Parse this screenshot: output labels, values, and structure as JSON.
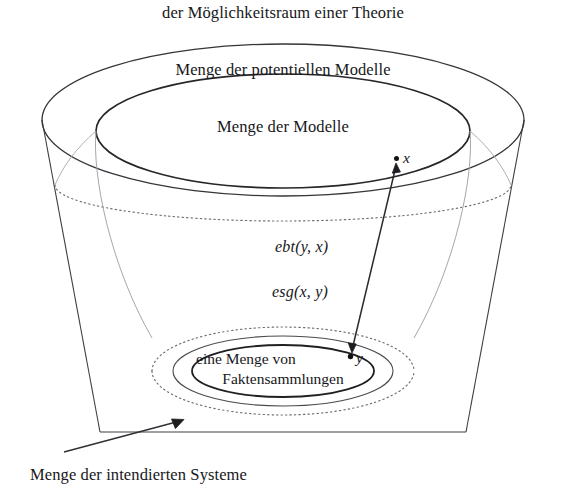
{
  "figure": {
    "title": "der Möglichkeitsraum einer Theorie",
    "caption": "Menge der intendierten Systeme",
    "labels": {
      "potential_models": "Menge der potentiellen Modelle",
      "models": "Menge der Modelle",
      "facts_line1": "eine Menge von",
      "facts_line2": "Faktensammlungen"
    },
    "relations": {
      "ebt": "ebt(y, x)",
      "esg": "esg(x, y)"
    },
    "points": {
      "x": "x",
      "y": "y"
    },
    "colors": {
      "ink": "#17171a",
      "stroke_solid": "#3a3a3e",
      "stroke_faint": "#9a9aa0",
      "stroke_dotted": "#6e6e74",
      "background": "#ffffff"
    }
  }
}
